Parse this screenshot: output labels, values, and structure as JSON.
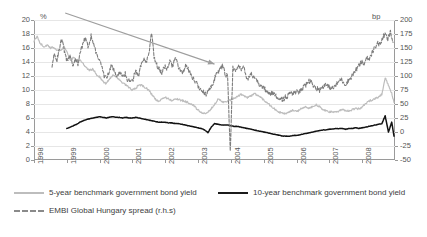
{
  "chart_data": {
    "type": "line",
    "title": "",
    "xlabel": "",
    "ylabel": "%",
    "ylabel_right": "bp",
    "ylim": [
      0,
      20
    ],
    "ylim_right": [
      -50,
      200
    ],
    "grid": true,
    "legend_position": "bottom-left",
    "x_tick_labels": [
      "1998",
      "1999",
      "2000",
      "2001",
      "2002",
      "2003",
      "2004",
      "2005",
      "2006",
      "2007",
      "2008"
    ],
    "y_tick_labels": [
      "0",
      "2",
      "4",
      "6",
      "8",
      "10",
      "12",
      "14",
      "16",
      "18",
      "20"
    ],
    "y_tick_labels_right": [
      "-50",
      "-25",
      "0",
      "25",
      "50",
      "75",
      "100",
      "125",
      "150",
      "175",
      "200"
    ],
    "annotations": [
      {
        "name": "declining-trend-arrow",
        "type": "arrow",
        "color": "#9e9e9e",
        "from_x": 1998.95,
        "from_y_pct": 21.0,
        "to_x": 2003.5,
        "to_y_pct": 13.7
      }
    ],
    "series": [
      {
        "name": "5-year benchmark government bond yield",
        "axis": "left",
        "color": "#bdbdbd",
        "style": "solid",
        "legend_label": "5-year benchmark government bond yield",
        "x": [
          1998.0,
          1998.1,
          1998.2,
          1998.3,
          1998.4,
          1998.5,
          1998.6,
          1998.7,
          1998.8,
          1998.9,
          1999.0,
          1999.1,
          1999.2,
          1999.3,
          1999.4,
          1999.5,
          1999.6,
          1999.7,
          1999.8,
          1999.9,
          2000.0,
          2000.1,
          2000.2,
          2000.3,
          2000.4,
          2000.5,
          2000.6,
          2000.7,
          2000.8,
          2000.9,
          2001.0,
          2001.1,
          2001.2,
          2001.3,
          2001.4,
          2001.5,
          2001.6,
          2001.7,
          2001.8,
          2001.9,
          2002.0,
          2002.1,
          2002.2,
          2002.3,
          2002.4,
          2002.5,
          2002.6,
          2002.7,
          2002.8,
          2002.9,
          2003.0,
          2003.1,
          2003.2,
          2003.3,
          2003.4,
          2003.5,
          2003.6,
          2003.7,
          2003.8,
          2003.9,
          2004.0,
          2004.1,
          2004.2,
          2004.3,
          2004.4,
          2004.5,
          2004.6,
          2004.7,
          2004.8,
          2004.9,
          2005.0,
          2005.1,
          2005.2,
          2005.3,
          2005.4,
          2005.5,
          2005.6,
          2005.7,
          2005.8,
          2005.9,
          2006.0,
          2006.1,
          2006.2,
          2006.3,
          2006.4,
          2006.5,
          2006.6,
          2006.7,
          2006.8,
          2006.9,
          2007.0,
          2007.1,
          2007.2,
          2007.3,
          2007.4,
          2007.5,
          2007.6,
          2007.7,
          2007.8,
          2007.9,
          2008.0,
          2008.1,
          2008.2,
          2008.3,
          2008.4,
          2008.5,
          2008.6,
          2008.7,
          2008.8,
          2008.9,
          2008.97
        ],
        "y": [
          17.0,
          17.6,
          16.6,
          16.2,
          16.4,
          16.0,
          16.1,
          15.7,
          15.6,
          16.1,
          15.6,
          14.3,
          14.6,
          14.2,
          14.4,
          13.7,
          13.1,
          12.8,
          13.0,
          12.2,
          11.9,
          11.2,
          10.9,
          11.6,
          12.1,
          12.0,
          11.4,
          11.0,
          10.7,
          10.3,
          10.0,
          10.2,
          10.8,
          10.6,
          10.3,
          10.0,
          9.3,
          8.7,
          8.3,
          8.7,
          9.0,
          8.7,
          8.5,
          8.8,
          8.6,
          8.5,
          8.4,
          8.2,
          8.0,
          7.6,
          7.1,
          6.8,
          6.6,
          6.8,
          7.3,
          8.0,
          8.6,
          8.5,
          8.2,
          8.4,
          8.6,
          8.8,
          9.0,
          9.4,
          9.2,
          8.9,
          9.1,
          9.5,
          9.3,
          9.0,
          8.6,
          8.2,
          7.8,
          7.4,
          7.0,
          6.8,
          6.6,
          6.7,
          6.9,
          7.1,
          6.9,
          7.2,
          7.5,
          7.6,
          7.4,
          7.7,
          7.9,
          7.6,
          7.2,
          7.0,
          6.9,
          6.8,
          6.9,
          7.0,
          7.2,
          7.1,
          7.0,
          7.2,
          7.4,
          7.3,
          7.6,
          8.0,
          8.4,
          8.6,
          8.8,
          9.0,
          9.4,
          11.8,
          10.6,
          9.5,
          8.2
        ]
      },
      {
        "name": "10-year benchmark government bond yield",
        "axis": "left",
        "color": "#121212",
        "style": "solid",
        "legend_label": "10-year benchmark government bond yield",
        "x": [
          1999.0,
          1999.1,
          1999.2,
          1999.3,
          1999.4,
          1999.5,
          1999.6,
          1999.7,
          1999.8,
          1999.9,
          2000.0,
          2000.1,
          2000.2,
          2000.3,
          2000.4,
          2000.5,
          2000.6,
          2000.7,
          2000.8,
          2000.9,
          2001.0,
          2001.1,
          2001.2,
          2001.3,
          2001.4,
          2001.5,
          2001.6,
          2001.7,
          2001.8,
          2001.9,
          2002.0,
          2002.1,
          2002.2,
          2002.3,
          2002.4,
          2002.5,
          2002.6,
          2002.7,
          2002.8,
          2002.9,
          2003.0,
          2003.1,
          2003.2,
          2003.3,
          2003.4,
          2003.5,
          2003.6,
          2003.7,
          2003.8,
          2003.9,
          2004.0,
          2004.1,
          2004.2,
          2004.3,
          2004.4,
          2004.5,
          2004.6,
          2004.7,
          2004.8,
          2004.9,
          2005.0,
          2005.1,
          2005.2,
          2005.3,
          2005.4,
          2005.5,
          2005.6,
          2005.7,
          2005.8,
          2005.9,
          2006.0,
          2006.1,
          2006.2,
          2006.3,
          2006.4,
          2006.5,
          2006.6,
          2006.7,
          2006.8,
          2006.9,
          2007.0,
          2007.1,
          2007.2,
          2007.3,
          2007.4,
          2007.5,
          2007.6,
          2007.7,
          2007.8,
          2007.9,
          2008.0,
          2008.1,
          2008.2,
          2008.3,
          2008.4,
          2008.5,
          2008.6,
          2008.7,
          2008.8,
          2008.9,
          2008.97
        ],
        "y": [
          4.5,
          4.7,
          4.9,
          5.1,
          5.4,
          5.6,
          5.8,
          5.9,
          6.0,
          6.1,
          6.2,
          6.1,
          6.0,
          6.1,
          6.2,
          6.1,
          6.1,
          6.0,
          6.1,
          6.0,
          6.0,
          6.1,
          6.0,
          5.9,
          5.8,
          5.7,
          5.6,
          5.5,
          5.4,
          5.4,
          5.4,
          5.3,
          5.3,
          5.2,
          5.2,
          5.1,
          5.0,
          4.9,
          4.8,
          4.7,
          4.6,
          4.5,
          4.3,
          3.9,
          4.7,
          5.2,
          5.1,
          5.0,
          5.0,
          5.0,
          4.9,
          4.8,
          4.8,
          4.7,
          4.6,
          4.5,
          4.4,
          4.3,
          4.2,
          4.1,
          4.0,
          3.9,
          3.8,
          3.7,
          3.6,
          3.5,
          3.4,
          3.4,
          3.4,
          3.5,
          3.5,
          3.6,
          3.7,
          3.8,
          3.9,
          4.0,
          4.1,
          4.2,
          4.3,
          4.3,
          4.4,
          4.4,
          4.5,
          4.5,
          4.5,
          4.4,
          4.5,
          4.5,
          4.6,
          4.5,
          4.6,
          4.7,
          4.8,
          4.9,
          5.0,
          5.1,
          5.2,
          6.3,
          4.0,
          5.4,
          3.4
        ]
      },
      {
        "name": "EMBI Global Hungary spread (r.h.s)",
        "axis": "right",
        "color": "#7d7d7d",
        "style": "dashed",
        "legend_label": "EMBI Global Hungary spread (r.h.s)",
        "x": [
          1998.55,
          1998.62,
          1998.7,
          1998.78,
          1998.86,
          1998.94,
          1999.02,
          1999.1,
          1999.18,
          1999.26,
          1999.34,
          1999.42,
          1999.5,
          1999.58,
          1999.66,
          1999.74,
          1999.82,
          1999.9,
          1999.98,
          2000.06,
          2000.14,
          2000.22,
          2000.3,
          2000.38,
          2000.46,
          2000.54,
          2000.62,
          2000.7,
          2000.78,
          2000.86,
          2000.94,
          2001.02,
          2001.1,
          2001.18,
          2001.26,
          2001.34,
          2001.42,
          2001.5,
          2001.58,
          2001.66,
          2001.74,
          2001.82,
          2001.9,
          2001.98,
          2002.06,
          2002.14,
          2002.22,
          2002.3,
          2002.38,
          2002.46,
          2002.54,
          2002.62,
          2002.7,
          2002.78,
          2002.86,
          2002.94,
          2003.02,
          2003.1,
          2003.18,
          2003.26,
          2003.34,
          2003.42,
          2003.5,
          2003.58,
          2003.66,
          2003.74,
          2003.82,
          2003.9,
          2003.98,
          2004.06,
          2004.14,
          2004.22,
          2004.3,
          2004.38,
          2004.46,
          2004.54,
          2004.62,
          2004.7,
          2004.78,
          2004.86,
          2004.94,
          2005.02,
          2005.1,
          2005.18,
          2005.26,
          2005.34,
          2005.42,
          2005.5,
          2005.58,
          2005.66,
          2005.74,
          2005.82,
          2005.9,
          2005.98,
          2006.06,
          2006.14,
          2006.22,
          2006.3,
          2006.38,
          2006.46,
          2006.54,
          2006.62,
          2006.7,
          2006.78,
          2006.86,
          2006.94,
          2007.02,
          2007.1,
          2007.18,
          2007.26,
          2007.34,
          2007.42,
          2007.5,
          2007.58,
          2007.66,
          2007.74,
          2007.82,
          2007.9,
          2007.98,
          2008.06,
          2008.14,
          2008.22,
          2008.3,
          2008.38,
          2008.46,
          2008.54,
          2008.62,
          2008.7,
          2008.78,
          2008.86,
          2008.94
        ],
        "y": [
          112,
          141,
          128,
          150,
          168,
          141,
          125,
          137,
          118,
          132,
          120,
          142,
          160,
          170,
          150,
          173,
          155,
          140,
          130,
          118,
          100,
          95,
          112,
          120,
          105,
          98,
          110,
          97,
          105,
          92,
          88,
          95,
          108,
          100,
          118,
          130,
          122,
          140,
          175,
          135,
          120,
          112,
          105,
          118,
          110,
          125,
          118,
          132,
          120,
          110,
          105,
          118,
          112,
          100,
          95,
          88,
          80,
          75,
          70,
          68,
          75,
          82,
          95,
          105,
          112,
          118,
          105,
          98,
          -38,
          115,
          108,
          120,
          112,
          118,
          100,
          95,
          105,
          98,
          90,
          85,
          80,
          78,
          72,
          68,
          70,
          65,
          62,
          60,
          58,
          62,
          65,
          70,
          68,
          72,
          70,
          75,
          80,
          85,
          92,
          88,
          82,
          78,
          75,
          80,
          85,
          82,
          80,
          78,
          82,
          88,
          95,
          90,
          85,
          92,
          98,
          105,
          112,
          118,
          125,
          120,
          135,
          128,
          142,
          150,
          160,
          155,
          168,
          175,
          165,
          178,
          160
        ]
      }
    ]
  },
  "axes": {
    "left_unit": "%",
    "right_unit": "bp"
  }
}
